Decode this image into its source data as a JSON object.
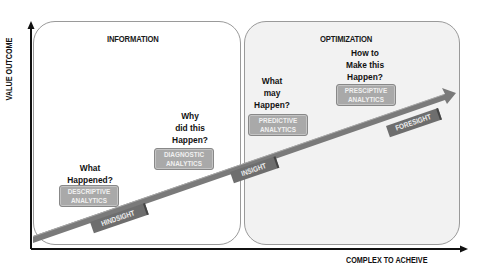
{
  "axes": {
    "y_label": "VALUE OUTCOME",
    "x_label": "COMPLEX TO ACHEIVE"
  },
  "panels": {
    "information": {
      "title": "INFORMATION"
    },
    "optimization": {
      "title": "OPTIMIZATION"
    }
  },
  "stages": [
    {
      "question": "What Happened?",
      "q_lines": [
        "What",
        "Happened?"
      ],
      "box_lines": [
        "DESCRIPTIVE",
        "ANALYTICS"
      ],
      "sight": "HINDSIGHT"
    },
    {
      "question": "Why did this Happen?",
      "q_lines": [
        "Why",
        "did this",
        "Happen?"
      ],
      "box_lines": [
        "DIAGNOSTIC",
        "ANALYTICS"
      ],
      "sight": "INSIGHT"
    },
    {
      "question": "What may Happen?",
      "q_lines": [
        "What",
        "may",
        "Happen?"
      ],
      "box_lines": [
        "PREDICTIVE",
        "ANALYTICS"
      ],
      "sight": ""
    },
    {
      "question": "How to Make this Happen?",
      "q_lines": [
        "How to",
        "Make this",
        "Happen?"
      ],
      "box_lines": [
        "PRESCIPTIVE",
        "ANALYTICS"
      ],
      "sight": "FORESIGHT"
    }
  ],
  "colors": {
    "arrow": "#7a7a7a",
    "analytics_box": "#a9a9a9",
    "sight_label": "#6e6e6e",
    "optimization_bg": "#f2f2f2",
    "axis": "#111111"
  }
}
